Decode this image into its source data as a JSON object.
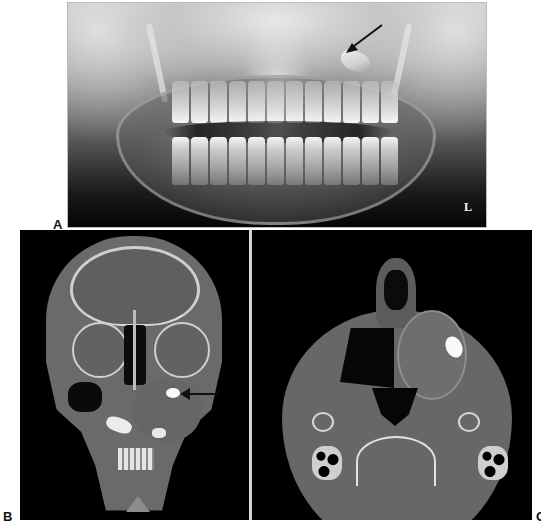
{
  "figure": {
    "panels": [
      {
        "id": "A",
        "label": "A",
        "modality": "Panoramic radiograph",
        "side_marker": "L",
        "annotations": [
          {
            "type": "arrow",
            "target": "ectopic tooth near left maxillary region"
          }
        ]
      },
      {
        "id": "B",
        "label": "B",
        "modality": "Coronal CT",
        "annotations": [
          {
            "type": "arrow",
            "target": "calcified focus within left maxillary sinus mass"
          }
        ]
      },
      {
        "id": "C",
        "label": "C",
        "modality": "Axial CT",
        "annotations": []
      }
    ],
    "colors": {
      "background": "#ffffff",
      "panel_background": "#000000",
      "label_text": "#111111",
      "arrow": "#111111"
    }
  }
}
